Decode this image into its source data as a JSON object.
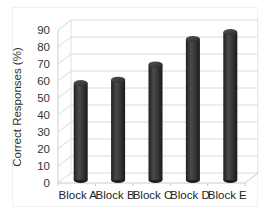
{
  "chart_data": {
    "type": "bar",
    "style": "3d-cylinder",
    "title": "",
    "xlabel": "",
    "ylabel": "Correct Responses (%)",
    "categories": [
      "Block A",
      "Block B",
      "Block C",
      "Block D",
      "Block E"
    ],
    "values": [
      57,
      59,
      68,
      83,
      87
    ],
    "ylim": [
      0,
      90
    ],
    "yticks": [
      0,
      10,
      20,
      30,
      40,
      50,
      60,
      70,
      80,
      90
    ],
    "grid": true,
    "legend": null,
    "bar_color": "#3a3a3a",
    "gridline_color": "#d9d9d9"
  }
}
